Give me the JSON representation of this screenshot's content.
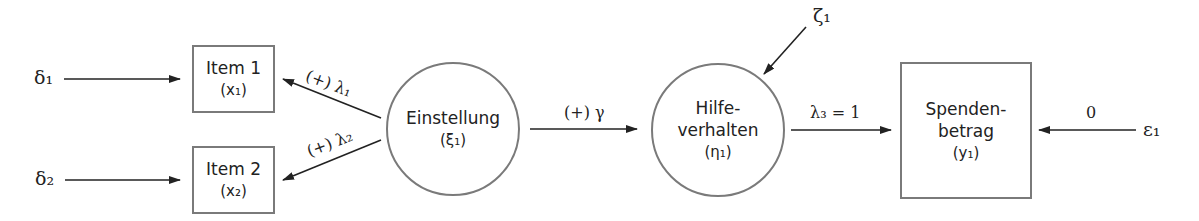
{
  "diagram": {
    "type": "structural-equation-model",
    "nodes": {
      "item1": {
        "label": "Item 1",
        "var": "(x₁)",
        "shape": "rect"
      },
      "item2": {
        "label": "Item 2",
        "var": "(x₂)",
        "shape": "rect"
      },
      "einstellung": {
        "label": "Einstellung",
        "var": "(ξ₁)",
        "shape": "circle"
      },
      "hilfeverhalten": {
        "label_line1": "Hilfe-",
        "label_line2": "verhalten",
        "var": "(η₁)",
        "shape": "circle"
      },
      "spendenbetrag": {
        "label_line1": "Spenden-",
        "label_line2": "betrag",
        "var": "(y₁)",
        "shape": "rect"
      }
    },
    "error_terms": {
      "delta1": "δ₁",
      "delta2": "δ₂",
      "zeta1": "ζ₁",
      "epsilon1": "ε₁"
    },
    "edges": {
      "lambda1": "(+) λ₁",
      "lambda2": "(+) λ₂",
      "gamma": "(+) γ",
      "lambda3": "λ₃ = 1",
      "epsilon_weight": "0"
    },
    "colors": {
      "stroke": "#7a7a7a",
      "arrow": "#222222",
      "text": "#222222"
    }
  }
}
